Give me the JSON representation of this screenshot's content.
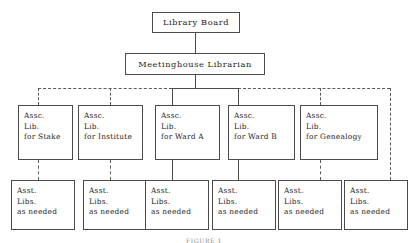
{
  "diagram": {
    "caption": "FIGURE 1",
    "colors": {
      "line": "#4a4a4a",
      "dashed_line": "#5a5a5a",
      "text": "#1c1c1c",
      "background": "#ffffff"
    },
    "nodes": {
      "board": {
        "label": "Library Board"
      },
      "librarian": {
        "label": "Meetinghouse Librarian"
      },
      "associates": [
        {
          "line1": "Assc.",
          "line2": "Lib.",
          "line3": "for Stake"
        },
        {
          "line1": "Assc.",
          "line2": "Lib.",
          "line3": "for Institute"
        },
        {
          "line1": "Assc.",
          "line2": "Lib.",
          "line3": "for Ward A"
        },
        {
          "line1": "Assc.",
          "line2": "Lib.",
          "line3": "for Ward B"
        },
        {
          "line1": "Assc.",
          "line2": "Lib.",
          "line3": "for Genealogy"
        }
      ],
      "assistants": [
        {
          "line1": "Asst.",
          "line2": "Libs.",
          "line3": "as needed"
        },
        {
          "line1": "Asst.",
          "line2": "Libs.",
          "line3": "as needed"
        },
        {
          "line1": "Asst.",
          "line2": "Libs.",
          "line3": "as needed"
        },
        {
          "line1": "Asst.",
          "line2": "Libs.",
          "line3": "as needed"
        },
        {
          "line1": "Asst.",
          "line2": "Libs.",
          "line3": "as needed"
        },
        {
          "line1": "Asst.",
          "line2": "Libs.",
          "line3": "as needed"
        }
      ]
    }
  }
}
